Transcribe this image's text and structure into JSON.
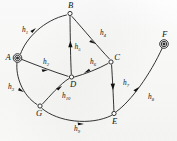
{
  "figure": {
    "background_color": "#fdfdfb",
    "ink_color": "#1d1d1d"
  },
  "nodes": [
    {
      "id": "A",
      "label": "A",
      "x": 17.5,
      "y": 58.0,
      "style": "double-circle",
      "label_dx": -9.5,
      "label_dy": 1.5
    },
    {
      "id": "B",
      "label": "B",
      "x": 70.0,
      "y": 13.5,
      "style": "circle",
      "label_dx": 0.5,
      "label_dy": -5.5
    },
    {
      "id": "C",
      "label": "C",
      "x": 111.0,
      "y": 62.0,
      "style": "circle",
      "label_dx": 6.0,
      "label_dy": -2.0
    },
    {
      "id": "D",
      "label": "D",
      "x": 71.5,
      "y": 77.0,
      "style": "circle",
      "label_dx": 1.5,
      "label_dy": 9.5
    },
    {
      "id": "E",
      "label": "E",
      "x": 114.0,
      "y": 113.5,
      "style": "circle",
      "label_dx": 0.5,
      "label_dy": 10.0
    },
    {
      "id": "F",
      "label": "F",
      "x": 164.0,
      "y": 44.0,
      "style": "double-circle",
      "label_dx": 0.5,
      "label_dy": -7.0
    },
    {
      "id": "G",
      "label": "G",
      "x": 40.0,
      "y": 106.0,
      "style": "circle",
      "label_dx": -1.0,
      "label_dy": 10.0
    }
  ],
  "edges": [
    {
      "id": "h1",
      "name": "h",
      "sub": "1",
      "from": "A",
      "to": "B",
      "label_x": 22.0,
      "label_y": 32.0
    },
    {
      "id": "h2",
      "name": "h",
      "sub": "2",
      "from": "A",
      "to": "D",
      "label_x": 43.0,
      "label_y": 64.0
    },
    {
      "id": "h3",
      "name": "h",
      "sub": "3",
      "from": "A",
      "to": "G",
      "label_x": 8.0,
      "label_y": 89.0
    },
    {
      "id": "h4",
      "name": "h",
      "sub": "4",
      "from": "B",
      "to": "C",
      "label_x": 100.0,
      "label_y": 35.0
    },
    {
      "id": "h5",
      "name": "h",
      "sub": "5",
      "from": "D",
      "to": "B",
      "label_x": 74.5,
      "label_y": 49.0
    },
    {
      "id": "h6",
      "name": "h",
      "sub": "6",
      "from": "C",
      "to": "D",
      "label_x": 90.0,
      "label_y": 64.0
    },
    {
      "id": "h7",
      "name": "h",
      "sub": "7",
      "from": "C",
      "to": "E",
      "label_x": 123.0,
      "label_y": 85.0
    },
    {
      "id": "h8",
      "name": "h",
      "sub": "8",
      "from": "E",
      "to": "F",
      "label_x": 148.0,
      "label_y": 99.0
    },
    {
      "id": "h9",
      "name": "h",
      "sub": "9",
      "from": "G",
      "to": "E",
      "label_x": 74.0,
      "label_y": 131.0
    },
    {
      "id": "h10",
      "name": "h",
      "sub": "10",
      "from": "G",
      "to": "D",
      "label_x": 62.0,
      "label_y": 98.0
    }
  ]
}
